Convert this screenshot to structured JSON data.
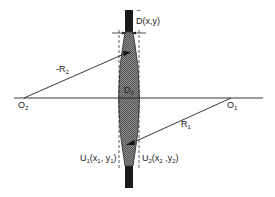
{
  "figure": {
    "type": "lens-geometry",
    "labels": {
      "thickness": "D(x,y)",
      "thickness_bar": "‾",
      "center_thickness": "D",
      "center_thickness_sub": "0",
      "radius_left": "-R",
      "radius_left_sub": "2",
      "radius_right": "R",
      "radius_right_sub": "1",
      "center_left": "O",
      "center_left_sub": "2",
      "center_right": "O",
      "center_right_sub": "1",
      "plane_left": "U",
      "plane_left_sub": "1",
      "plane_left_coords_open": "(x",
      "plane_left_coords_x_sub": "1",
      "plane_left_coords_mid": ", y",
      "plane_left_coords_y_sub": "1",
      "plane_left_coords_close": ")",
      "plane_right": "U",
      "plane_right_sub": "2",
      "plane_right_coords_open": "(x",
      "plane_right_coords_x_sub": "2",
      "plane_right_coords_mid": " ,y",
      "plane_right_coords_y_sub": "2",
      "plane_right_coords_close": ")"
    },
    "colors": {
      "line": "#222222",
      "lens_fill": "#7a7a7a",
      "mount_fill": "#1a1a1a",
      "background": "#ffffff"
    }
  }
}
